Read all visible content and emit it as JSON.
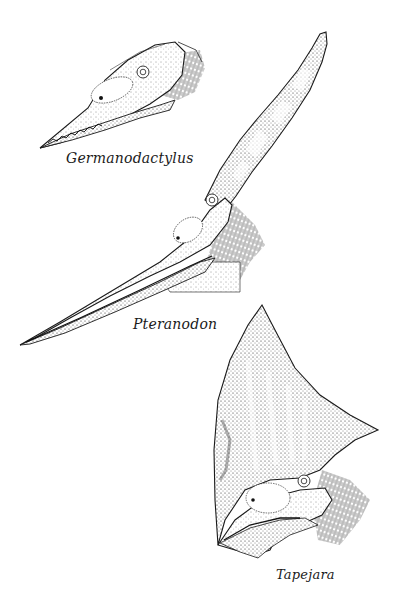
{
  "plate": {
    "description": "Pen-and-ink stipple illustration of three pterosaur heads with crests",
    "background": "#ffffff",
    "ink": "#1a1a1a"
  },
  "specimens": [
    {
      "id": "germanodactylus",
      "caption": "Germanodactylus"
    },
    {
      "id": "pteranodon",
      "caption": "Pteranodon"
    },
    {
      "id": "tapejara",
      "caption": "Tapejara"
    }
  ]
}
